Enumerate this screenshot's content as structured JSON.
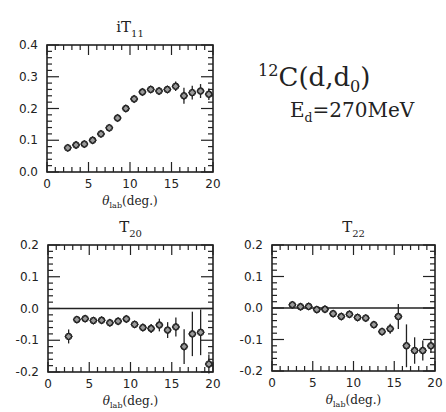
{
  "annotation": {
    "reaction_mass": "12",
    "reaction_main": "C(d,d",
    "reaction_sub": "0",
    "reaction_end": ")",
    "energy_main": "E",
    "energy_sub": "d",
    "energy_value": "=270MeV"
  },
  "chart_data": [
    {
      "type": "scatter",
      "title": "iT11",
      "title_main": "iT",
      "title_sub": "11",
      "xlabel": "θlab(deg.)",
      "xlabel_main": "θ",
      "xlabel_sub": "lab",
      "xlabel_end": "(deg.)",
      "ylabel": "",
      "xlim": [
        0,
        20
      ],
      "ylim": [
        0.0,
        0.4
      ],
      "xticks": [
        "0",
        "5",
        "10",
        "15",
        "20"
      ],
      "yticks": [
        "0.0",
        "0.1",
        "0.2",
        "0.3",
        "0.4"
      ],
      "zero_line": false,
      "frame": {
        "x0": 47,
        "x1": 213,
        "y0": 45,
        "y1": 172
      },
      "x": [
        2.5,
        3.5,
        4.5,
        5.5,
        6.5,
        7.5,
        8.5,
        9.5,
        10.5,
        11.5,
        12.5,
        13.5,
        14.5,
        15.5,
        16.5,
        17.5,
        18.5,
        19.5
      ],
      "values": [
        0.076,
        0.085,
        0.088,
        0.1,
        0.12,
        0.139,
        0.17,
        0.2,
        0.23,
        0.252,
        0.26,
        0.255,
        0.26,
        0.27,
        0.24,
        0.25,
        0.255,
        0.245
      ],
      "errors": [
        0.005,
        0.005,
        0.005,
        0.005,
        0.005,
        0.005,
        0.006,
        0.006,
        0.006,
        0.007,
        0.007,
        0.008,
        0.01,
        0.015,
        0.025,
        0.022,
        0.022,
        0.018
      ]
    },
    {
      "type": "scatter",
      "title": "T20",
      "title_main": "T",
      "title_sub": "20",
      "xlabel": "θlab(deg.)",
      "xlabel_main": "θ",
      "xlabel_sub": "lab",
      "xlabel_end": "(deg.)",
      "ylabel": "",
      "xlim": [
        0,
        20
      ],
      "ylim": [
        -0.2,
        0.2
      ],
      "xticks": [
        "0",
        "5",
        "10",
        "15",
        "20"
      ],
      "yticks": [
        "-0.2",
        "-0.1",
        "0.0",
        "0.1",
        "0.2"
      ],
      "zero_line": true,
      "frame": {
        "x0": 48,
        "x1": 213,
        "y0": 245,
        "y1": 372
      },
      "x": [
        2.5,
        3.5,
        4.5,
        5.5,
        6.5,
        7.5,
        8.5,
        9.5,
        10.5,
        11.5,
        12.5,
        13.5,
        14.5,
        15.5,
        16.5,
        17.5,
        18.5,
        19.5
      ],
      "values": [
        -0.088,
        -0.035,
        -0.032,
        -0.038,
        -0.037,
        -0.045,
        -0.04,
        -0.033,
        -0.05,
        -0.06,
        -0.063,
        -0.052,
        -0.068,
        -0.058,
        -0.12,
        -0.08,
        -0.075,
        -0.175
      ],
      "errors": [
        0.022,
        0.006,
        0.006,
        0.006,
        0.006,
        0.006,
        0.006,
        0.007,
        0.01,
        0.012,
        0.014,
        0.02,
        0.025,
        0.03,
        0.055,
        0.07,
        0.072,
        0.03
      ]
    },
    {
      "type": "scatter",
      "title": "T22",
      "title_main": "T",
      "title_sub": "22",
      "xlabel": "θlab(deg.)",
      "xlabel_main": "θ",
      "xlabel_sub": "lab",
      "xlabel_end": "(deg.)",
      "ylabel": "",
      "xlim": [
        0,
        20
      ],
      "ylim": [
        -0.2,
        0.2
      ],
      "xticks": [
        "0",
        "5",
        "10",
        "15",
        "20"
      ],
      "yticks": [
        "-0.2",
        "-0.1",
        "0.0",
        "0.1",
        "0.2"
      ],
      "zero_line": true,
      "frame": {
        "x0": 272,
        "x1": 435,
        "y0": 245,
        "y1": 371
      },
      "x": [
        2.5,
        3.5,
        4.5,
        5.5,
        6.5,
        7.5,
        8.5,
        9.5,
        10.5,
        11.5,
        12.5,
        13.5,
        14.5,
        15.5,
        16.5,
        17.5,
        18.5,
        19.5
      ],
      "values": [
        0.01,
        0.004,
        0.005,
        -0.005,
        -0.004,
        -0.018,
        -0.027,
        -0.02,
        -0.03,
        -0.032,
        -0.053,
        -0.075,
        -0.066,
        -0.027,
        -0.12,
        -0.135,
        -0.135,
        -0.12
      ],
      "errors": [
        0.006,
        0.005,
        0.005,
        0.005,
        0.005,
        0.006,
        0.006,
        0.006,
        0.006,
        0.007,
        0.008,
        0.012,
        0.016,
        0.04,
        0.068,
        0.042,
        0.032,
        0.022
      ]
    }
  ]
}
